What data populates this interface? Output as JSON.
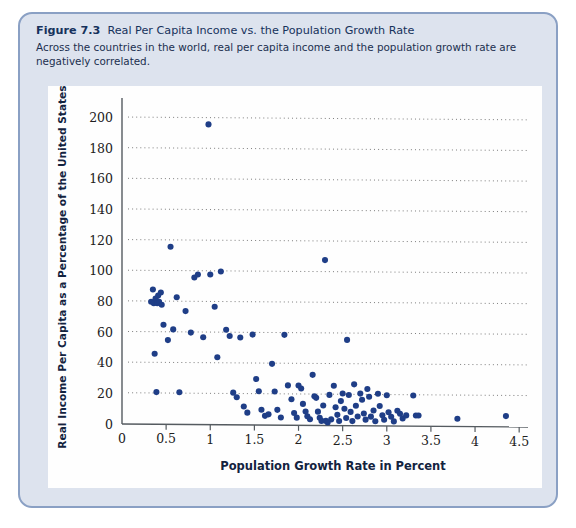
{
  "figure": {
    "number": "Figure 7.3",
    "title": "Real Per Capita Income vs. the Population Growth Rate",
    "subtitle": "Across the countries in the world, real per capita income and the population growth rate are negatively correlated."
  },
  "colors": {
    "card_background": "#dde3ee",
    "card_border": "#8aa0c4",
    "panel_background": "#fefefe",
    "dot": "#1f3e87",
    "grid": "#6f6f6f",
    "axis": "#555b60",
    "title_text": "#16325c"
  },
  "chart_data": {
    "type": "scatter",
    "title": "Real Per Capita Income vs. the Population Growth Rate",
    "xlabel": "Population Growth Rate in Percent",
    "ylabel": "Real Income Per Capita as a Percentage of the United States",
    "xlim": [
      0,
      4.6
    ],
    "ylim": [
      0,
      205
    ],
    "xticks": [
      0,
      0.5,
      1,
      1.5,
      2,
      2.5,
      3,
      3.5,
      4,
      4.5
    ],
    "xtick_labels": [
      "0",
      "0.5",
      "1",
      "1.5",
      "2",
      "2.5",
      "3",
      "3.5",
      "4",
      "4.5"
    ],
    "yticks": [
      0,
      20,
      40,
      60,
      80,
      100,
      120,
      140,
      160,
      180,
      200
    ],
    "ytick_labels": [
      "0",
      "20",
      "40",
      "60",
      "80",
      "100",
      "120",
      "140",
      "160",
      "180",
      "200"
    ],
    "grid": "horizontal-dotted",
    "legend": null,
    "series": [
      {
        "name": "Countries",
        "marker": "circle",
        "color": "#1f3e87",
        "points": [
          [
            0.33,
            80
          ],
          [
            0.36,
            79
          ],
          [
            0.38,
            82
          ],
          [
            0.4,
            79
          ],
          [
            0.41,
            84
          ],
          [
            0.42,
            80
          ],
          [
            0.44,
            86
          ],
          [
            0.45,
            78
          ],
          [
            0.35,
            88
          ],
          [
            0.37,
            46
          ],
          [
            0.39,
            21
          ],
          [
            0.47,
            65
          ],
          [
            0.52,
            55
          ],
          [
            0.55,
            116
          ],
          [
            0.58,
            62
          ],
          [
            0.62,
            83
          ],
          [
            0.65,
            21
          ],
          [
            0.72,
            74
          ],
          [
            0.78,
            60
          ],
          [
            0.82,
            96
          ],
          [
            0.86,
            98
          ],
          [
            0.92,
            57
          ],
          [
            0.98,
            196
          ],
          [
            1.0,
            98
          ],
          [
            1.05,
            77
          ],
          [
            1.08,
            44
          ],
          [
            1.12,
            100
          ],
          [
            1.18,
            62
          ],
          [
            1.22,
            58
          ],
          [
            1.26,
            21
          ],
          [
            1.3,
            18
          ],
          [
            1.34,
            57
          ],
          [
            1.38,
            12
          ],
          [
            1.42,
            8
          ],
          [
            1.48,
            59
          ],
          [
            1.52,
            30
          ],
          [
            1.55,
            22
          ],
          [
            1.58,
            10
          ],
          [
            1.62,
            6
          ],
          [
            1.66,
            7
          ],
          [
            1.7,
            40
          ],
          [
            1.73,
            22
          ],
          [
            1.76,
            10
          ],
          [
            1.8,
            5
          ],
          [
            1.84,
            59
          ],
          [
            1.88,
            26
          ],
          [
            1.92,
            17
          ],
          [
            1.95,
            8
          ],
          [
            1.98,
            5
          ],
          [
            2.0,
            26
          ],
          [
            2.03,
            24
          ],
          [
            2.05,
            14
          ],
          [
            2.08,
            9
          ],
          [
            2.1,
            6
          ],
          [
            2.13,
            4
          ],
          [
            2.16,
            33
          ],
          [
            2.18,
            19
          ],
          [
            2.2,
            18
          ],
          [
            2.22,
            9
          ],
          [
            2.24,
            5
          ],
          [
            2.26,
            3
          ],
          [
            2.28,
            13
          ],
          [
            2.3,
            108
          ],
          [
            2.31,
            3
          ],
          [
            2.33,
            2
          ],
          [
            2.35,
            20
          ],
          [
            2.37,
            4
          ],
          [
            2.4,
            26
          ],
          [
            2.42,
            12
          ],
          [
            2.44,
            7
          ],
          [
            2.46,
            3
          ],
          [
            2.48,
            16
          ],
          [
            2.5,
            21
          ],
          [
            2.52,
            11
          ],
          [
            2.54,
            5
          ],
          [
            2.55,
            56
          ],
          [
            2.57,
            20
          ],
          [
            2.59,
            9
          ],
          [
            2.61,
            3
          ],
          [
            2.63,
            27
          ],
          [
            2.65,
            13
          ],
          [
            2.67,
            6
          ],
          [
            2.7,
            21
          ],
          [
            2.72,
            17
          ],
          [
            2.74,
            8
          ],
          [
            2.76,
            4
          ],
          [
            2.78,
            24
          ],
          [
            2.8,
            19
          ],
          [
            2.82,
            6
          ],
          [
            2.85,
            10
          ],
          [
            2.87,
            3
          ],
          [
            2.9,
            21
          ],
          [
            2.92,
            13
          ],
          [
            2.95,
            7
          ],
          [
            2.97,
            4
          ],
          [
            3.0,
            20
          ],
          [
            3.02,
            9
          ],
          [
            3.05,
            6
          ],
          [
            3.08,
            3
          ],
          [
            3.12,
            10
          ],
          [
            3.15,
            8
          ],
          [
            3.18,
            5
          ],
          [
            3.22,
            7
          ],
          [
            3.3,
            20
          ],
          [
            3.33,
            7
          ],
          [
            3.36,
            7
          ],
          [
            3.8,
            5
          ],
          [
            4.35,
            7
          ]
        ]
      }
    ]
  }
}
